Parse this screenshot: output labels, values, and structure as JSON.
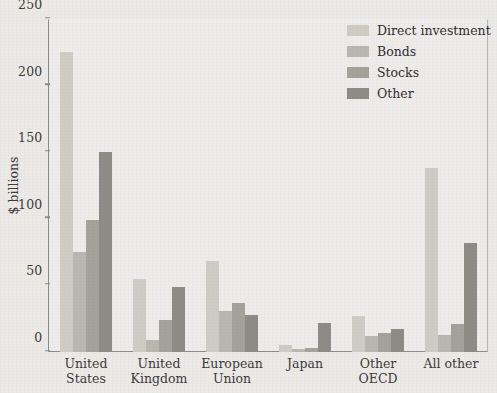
{
  "chart_data": {
    "type": "bar",
    "title": "",
    "xlabel": "",
    "ylabel": "$ billions",
    "ylim": [
      0,
      250
    ],
    "yticks": [
      0,
      50,
      100,
      150,
      200,
      250
    ],
    "grid": false,
    "legend_position": "top-right",
    "categories": [
      "United States",
      "United Kingdom",
      "European Union",
      "Japan",
      "Other OECD",
      "All other"
    ],
    "category_lines": [
      [
        "United",
        "States"
      ],
      [
        "United",
        "Kingdom"
      ],
      [
        "European",
        "Union"
      ],
      [
        "Japan",
        ""
      ],
      [
        "Other OECD",
        ""
      ],
      [
        "All other",
        ""
      ]
    ],
    "series": [
      {
        "name": "Direct investment",
        "color": "#cfccc6",
        "values": [
          225,
          55,
          68,
          5,
          27,
          138
        ]
      },
      {
        "name": "Bonds",
        "color": "#bab7b1",
        "values": [
          75,
          9,
          31,
          2,
          12,
          13
        ]
      },
      {
        "name": "Stocks",
        "color": "#a5a29c",
        "values": [
          99,
          24,
          37,
          3,
          14,
          21
        ]
      },
      {
        "name": "Other",
        "color": "#8f8c87",
        "values": [
          150,
          49,
          28,
          22,
          17,
          82
        ]
      }
    ]
  },
  "axis": {
    "y_title": "$ billions"
  },
  "colors": {
    "background": "#eceae6",
    "plot_background": "#eeecea",
    "axis_line": "#8b8b88",
    "text": "#3b3b3b"
  }
}
